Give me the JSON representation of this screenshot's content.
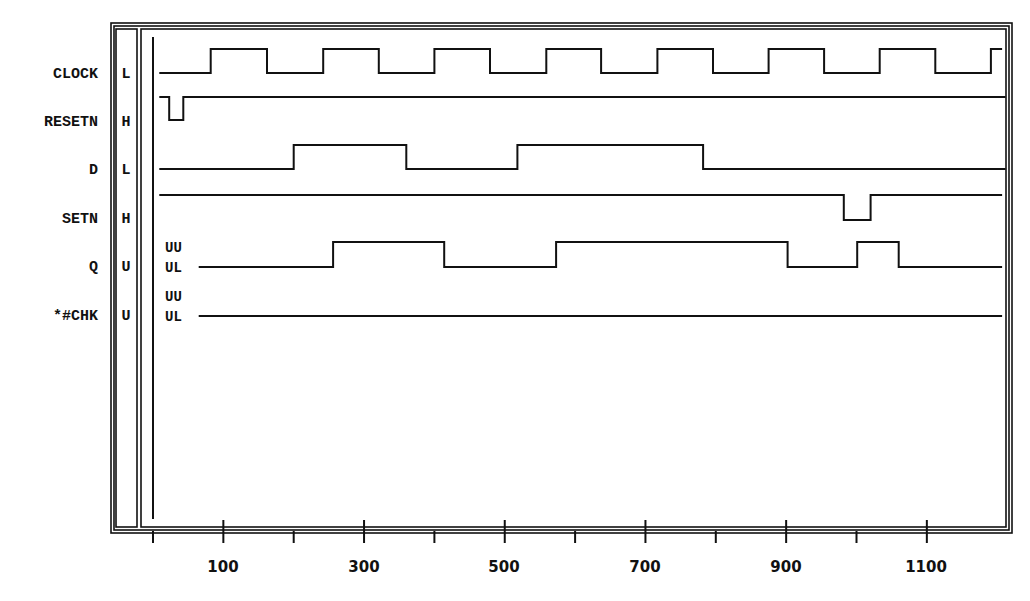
{
  "chart_data": {
    "type": "timing-diagram",
    "title": "",
    "xlabel": "time",
    "x_axis": {
      "min": 0,
      "max": 1200,
      "major_ticks": [
        100,
        300,
        500,
        700,
        900,
        1100
      ],
      "minor_ticks": [
        0,
        200,
        400,
        600,
        800,
        1000
      ],
      "tick_labels": [
        "100",
        "300",
        "500",
        "700",
        "900",
        "1100"
      ]
    },
    "signals": [
      {
        "name": "CLOCK",
        "initial_value": "L",
        "start_level": 0,
        "transitions": [
          {
            "t": 82,
            "level": 1
          },
          {
            "t": 162,
            "level": 0
          },
          {
            "t": 242,
            "level": 1
          },
          {
            "t": 321,
            "level": 0
          },
          {
            "t": 400,
            "level": 1
          },
          {
            "t": 479,
            "level": 0
          },
          {
            "t": 559,
            "level": 1
          },
          {
            "t": 637,
            "level": 0
          },
          {
            "t": 717,
            "level": 1
          },
          {
            "t": 796,
            "level": 0
          },
          {
            "t": 875,
            "level": 1
          },
          {
            "t": 954,
            "level": 0
          },
          {
            "t": 1033,
            "level": 1
          },
          {
            "t": 1112,
            "level": 0
          },
          {
            "t": 1191,
            "level": 1
          }
        ],
        "t_start": 9,
        "t_end": 1207
      },
      {
        "name": "RESETN",
        "initial_value": "H",
        "start_level": 1,
        "transitions": [
          {
            "t": 23,
            "level": 0
          },
          {
            "t": 43,
            "level": 1
          }
        ],
        "t_start": 9,
        "t_end": 1212
      },
      {
        "name": "D",
        "initial_value": "L",
        "start_level": 0,
        "transitions": [
          {
            "t": 200,
            "level": 1
          },
          {
            "t": 360,
            "level": 0
          },
          {
            "t": 518,
            "level": 1
          },
          {
            "t": 782,
            "level": 0
          }
        ],
        "t_start": 9,
        "t_end": 1212
      },
      {
        "name": "SETN",
        "initial_value": "H",
        "start_level": 1,
        "transitions": [
          {
            "t": 982,
            "level": 0
          },
          {
            "t": 1020,
            "level": 1
          }
        ],
        "t_start": 9,
        "t_end": 1207
      },
      {
        "name": "Q",
        "initial_value": "U",
        "start_level": 0,
        "initial_annotation": [
          "UU",
          "UL"
        ],
        "transitions": [
          {
            "t": 256,
            "level": 1
          },
          {
            "t": 414,
            "level": 0
          },
          {
            "t": 573,
            "level": 1
          },
          {
            "t": 902,
            "level": 0
          },
          {
            "t": 1001,
            "level": 1
          },
          {
            "t": 1060,
            "level": 0
          }
        ],
        "t_start": 65,
        "t_end": 1207
      },
      {
        "name": "*#CHK",
        "initial_value": "U",
        "start_level": 0,
        "initial_annotation": [
          "UU",
          "UL"
        ],
        "transitions": [],
        "t_start": 65,
        "t_end": 1207
      }
    ]
  },
  "labels": {
    "signal_names": [
      "CLOCK",
      "RESETN",
      "D",
      "SETN",
      "Q",
      "*#CHK"
    ],
    "signal_values": [
      "L",
      "H",
      "L",
      "H",
      "U",
      "U"
    ],
    "q_annotation": [
      "UU",
      "UL"
    ],
    "chk_annotation": [
      "UU",
      "UL"
    ],
    "ticks": [
      "100",
      "300",
      "500",
      "700",
      "900",
      "1100"
    ]
  }
}
